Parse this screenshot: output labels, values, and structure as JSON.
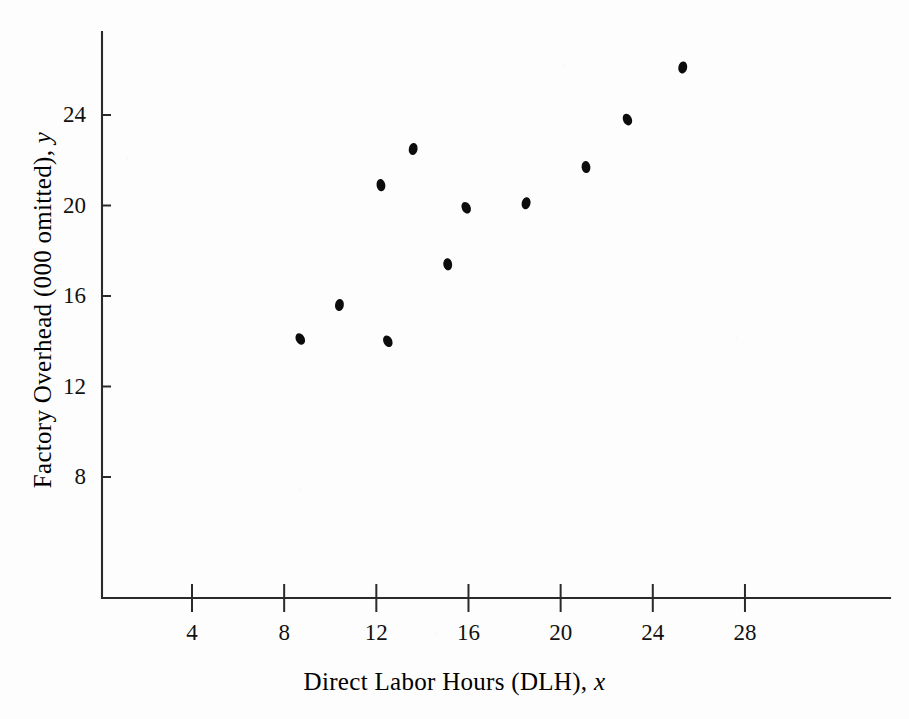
{
  "chart_data": {
    "type": "scatter",
    "title": "",
    "subtitle": "",
    "xlabel": "Direct Labor Hours (DLH), x",
    "ylabel": "Factory Overhead (000 omitted), y",
    "xlabel_text": "Direct Labor Hours (DLH),",
    "xlabel_var": "x",
    "ylabel_text": "Factory Overhead (000 omitted),",
    "ylabel_var": "y",
    "xticks": [
      4,
      8,
      12,
      16,
      20,
      24,
      28
    ],
    "yticks": [
      8,
      12,
      16,
      20,
      24
    ],
    "xtick_labels": [
      "4",
      "8",
      "12",
      "16",
      "20",
      "24",
      "28"
    ],
    "ytick_labels": [
      "8",
      "12",
      "16",
      "20",
      "24"
    ],
    "xlim": [
      0.5,
      30.2
    ],
    "ylim": [
      5.2,
      27.6
    ],
    "grid": false,
    "legend": null,
    "marker": {
      "shape": "filled-ellipse",
      "color": "#0c0c0c",
      "size_px": 9
    },
    "points": [
      {
        "x": 8.7,
        "y": 14.1
      },
      {
        "x": 10.4,
        "y": 15.6
      },
      {
        "x": 12.2,
        "y": 20.9
      },
      {
        "x": 12.5,
        "y": 14.0
      },
      {
        "x": 13.6,
        "y": 22.5
      },
      {
        "x": 15.1,
        "y": 17.4
      },
      {
        "x": 15.9,
        "y": 19.9
      },
      {
        "x": 18.5,
        "y": 20.1
      },
      {
        "x": 21.1,
        "y": 21.7
      },
      {
        "x": 22.9,
        "y": 23.8
      },
      {
        "x": 25.3,
        "y": 26.1
      }
    ],
    "axis_color": "#2a2a2a",
    "background_color": "#ffffff"
  },
  "figure": {
    "width": 909,
    "height": 719
  }
}
